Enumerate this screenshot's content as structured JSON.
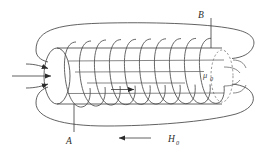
{
  "figure": {
    "background_color": "#ffffff",
    "line_color": "#3a3a3a",
    "dashed_color": "#7a7a7a",
    "width": 267,
    "height": 152
  },
  "labels": {
    "flux_density": {
      "symbol": "B",
      "subscript": "",
      "meaning": "magnetic flux density field line (outer loop, top)"
    },
    "area": {
      "symbol": "A",
      "subscript": "",
      "meaning": "cross-sectional area / core body leader (bottom left)"
    },
    "permeability": {
      "symbol": "μ",
      "subscript": "0",
      "meaning": "permeability of free space, region outside core at right end"
    },
    "magnetizing_field": {
      "symbol": "H",
      "subscript": "0",
      "meaning": "applied magnetizing field, directed leftward along bottom"
    }
  },
  "annotations": {
    "incoming_arrows_count": 3,
    "incoming_arrows_meaning": "field entering left face of cylindrical core",
    "interior_arrow_meaning": "field direction inside solenoid, pointing right",
    "h0_arrow_direction": "left",
    "coil_turns": 10,
    "interior_field_lines": 4,
    "exterior_return_lines": 2
  },
  "icons": {
    "arrow_right": "arrow-right-icon",
    "arrow_left": "arrow-left-icon",
    "coil": "helical-coil-icon",
    "cylinder": "cylinder-core-icon",
    "flux_loop": "closed-flux-loop-icon",
    "dashed_ellipse": "dashed-ellipse-icon"
  }
}
